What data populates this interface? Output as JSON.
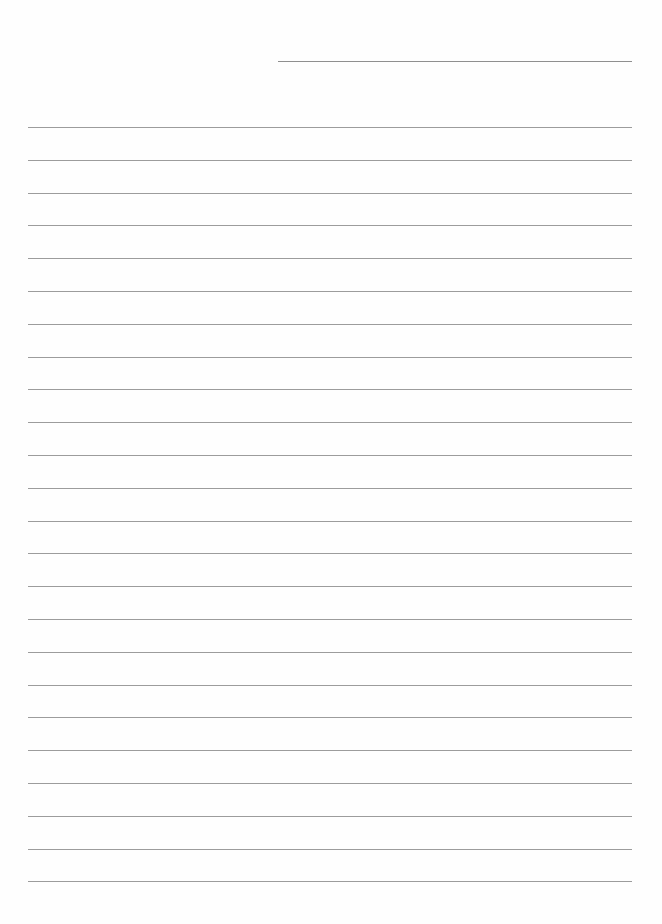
{
  "page": {
    "type": "lined-paper",
    "line_color": "#9c9c9c",
    "date_line": {
      "left": 278,
      "top": 61,
      "width": 354
    },
    "rules": {
      "count": 24,
      "left": 28,
      "width": 604,
      "first_top": 127,
      "spacing": 32.8
    }
  }
}
